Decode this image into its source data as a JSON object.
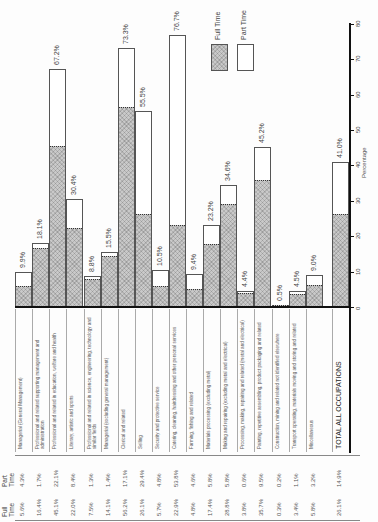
{
  "chart_data": {
    "type": "bar",
    "stacked": true,
    "orientation": "rotated (bars rise from baseline; printed sideways)",
    "title": "",
    "xlabel": "",
    "ylabel": "Percentage",
    "ylim": [
      0,
      80
    ],
    "yticks": [
      0,
      10,
      20,
      30,
      40,
      50,
      60,
      70,
      80
    ],
    "grid": false,
    "legend": {
      "position": "top-right",
      "entries": [
        "Full Time",
        "Part Time"
      ]
    },
    "categories": [
      "Managerial (General Management)",
      "Professional and related supporting management and administration",
      "Professional and related in education, welfare and health",
      "Literary, artistic and sports",
      "Professional and related in science, engineering, technology and similar fields",
      "Managerial (excluding general management)",
      "Clerical and related",
      "Selling",
      "Security and protective service",
      "Catering, cleaning, hairdressing and other personal services",
      "Farming, fishing and related",
      "Materials processing (excluding metal)",
      "Making and repairing (excluding metal and electrical)",
      "Processing, making, repairing and related (metal and electrical)",
      "Painting, repetitive assembling, product packaging and related",
      "Construction, mining and related not identified elsewhere",
      "Transport operating, materials moving and storing and related",
      "Miscellaneous",
      "TOTAL ALL OCCUPATIONS"
    ],
    "series": [
      {
        "name": "Full Time",
        "values": [
          5.6,
          16.4,
          45.1,
          22.0,
          7.5,
          14.1,
          56.2,
          26.1,
          5.7,
          22.9,
          4.8,
          17.4,
          28.8,
          3.8,
          35.7,
          0.3,
          3.4,
          5.8,
          26.1
        ]
      },
      {
        "name": "Part Time",
        "values": [
          4.3,
          1.7,
          22.1,
          8.4,
          1.3,
          1.4,
          17.1,
          29.4,
          4.8,
          53.8,
          4.6,
          5.8,
          5.8,
          0.6,
          9.5,
          0.2,
          1.1,
          3.2,
          14.9
        ]
      }
    ],
    "totals_labels": [
      "9.9%",
      "18.1%",
      "67.2%",
      "30.4%",
      "8.8%",
      "15.5%",
      "73.3%",
      "55.5%",
      "10.5%",
      "76.7%",
      "9.4%",
      "23.2%",
      "34.6%",
      "4.4%",
      "45.2%",
      "0.5%",
      "4.5%",
      "9.0%",
      "41.0%"
    ]
  },
  "legend": {
    "full_time": "Full Time",
    "part_time": "Part Time"
  },
  "axis": {
    "title": "Percentage",
    "ticks": [
      "0",
      "10",
      "20",
      "30",
      "40",
      "50",
      "60",
      "70",
      "80"
    ]
  },
  "table": {
    "headers": {
      "full_time": "Full Time",
      "part_time": "Part Time"
    },
    "full_time": [
      "5.6%",
      "16.4%",
      "45.1%",
      "22.0%",
      "7.5%",
      "14.1%",
      "56.2%",
      "26.1%",
      "5.7%",
      "22.9%",
      "4.8%",
      "17.4%",
      "28.8%",
      "3.8%",
      "35.7%",
      "0.3%",
      "3.4%",
      "5.8%",
      "26.1%"
    ],
    "part_time": [
      "4.3%",
      "1.7%",
      "22.1%",
      "8.4%",
      "1.3%",
      "1.4%",
      "17.1%",
      "29.4%",
      "4.8%",
      "53.8%",
      "4.6%",
      "5.8%",
      "5.8%",
      "0.6%",
      "9.5%",
      "0.2%",
      "1.1%",
      "3.2%",
      "14.9%"
    ]
  },
  "colors": {
    "full_time_fill": "#c9c9c9",
    "part_time_fill": "#ffffff",
    "axis": "#111111"
  }
}
